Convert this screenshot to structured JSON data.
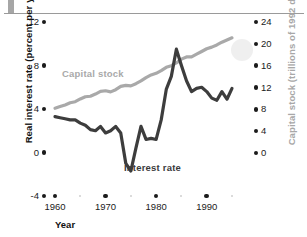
{
  "figure": {
    "left_axis_title": "Real interest rate (percent per year)",
    "right_axis_title": "Capital stock (trillions of 1992 dollars)",
    "x_axis_title": "Year",
    "series_labels": {
      "capital_stock": "Capital stock",
      "interest_rate": "Interest rate"
    },
    "colors": {
      "capital_stock": "#a9a9a9",
      "interest_rate": "#3d3d3d",
      "tick": "#1b1b1b",
      "minor_tick": "#cfcfcf",
      "rule": "#9a9a9a",
      "blob": "#ececec"
    }
  },
  "left_ticks": [
    "12",
    "8",
    "4",
    "0",
    "-4"
  ],
  "right_ticks": [
    "24",
    "20",
    "16",
    "12",
    "8",
    "4",
    "0"
  ],
  "x_ticks": [
    "1960",
    "1970",
    "1980",
    "1990"
  ],
  "chart_data": {
    "type": "line",
    "title": "",
    "xlabel": "Year",
    "ylabel": "Real interest rate (percent per year)",
    "y2label": "Capital stock (trillions of 1992 dollars)",
    "xlim": [
      1959,
      1996
    ],
    "ylim": [
      -4,
      12
    ],
    "y2lim": [
      0,
      24
    ],
    "grid": false,
    "legend": "inline-labels",
    "x_tick_labels": [
      "1960",
      "1970",
      "1980",
      "1990"
    ],
    "y_tick_labels": [
      "-4",
      "0",
      "4",
      "8",
      "12"
    ],
    "y2_tick_labels": [
      "0",
      "4",
      "8",
      "12",
      "16",
      "20",
      "24"
    ],
    "x": [
      1960,
      1961,
      1962,
      1963,
      1964,
      1965,
      1966,
      1967,
      1968,
      1969,
      1970,
      1971,
      1972,
      1973,
      1974,
      1975,
      1976,
      1977,
      1978,
      1979,
      1980,
      1981,
      1982,
      1983,
      1984,
      1985,
      1986,
      1987,
      1988,
      1989,
      1990,
      1991,
      1992,
      1993,
      1994,
      1995
    ],
    "series": [
      {
        "name": "Interest rate",
        "axis": "left",
        "color": "#3d3d3d",
        "unit": "percent per year",
        "values": [
          3.3,
          3.2,
          3.1,
          3.0,
          3.0,
          2.7,
          2.5,
          2.1,
          2.0,
          2.4,
          1.8,
          2.0,
          2.4,
          1.8,
          -1.0,
          -1.7,
          0.4,
          2.4,
          1.2,
          1.3,
          1.2,
          3.0,
          5.8,
          7.0,
          9.5,
          8.0,
          6.6,
          5.6,
          5.9,
          6.0,
          5.6,
          5.0,
          4.8,
          5.6,
          4.9,
          5.9
        ]
      },
      {
        "name": "Capital stock",
        "axis": "right",
        "color": "#a9a9a9",
        "unit": "trillions of 1992 dollars",
        "values": [
          8.2,
          8.5,
          8.8,
          9.2,
          9.4,
          9.9,
          10.3,
          10.4,
          10.8,
          11.3,
          11.4,
          11.2,
          11.6,
          12.2,
          12.4,
          12.3,
          12.7,
          13.2,
          13.8,
          14.3,
          14.6,
          15.1,
          15.7,
          16.0,
          16.5,
          17.2,
          17.6,
          17.6,
          18.1,
          18.6,
          19.1,
          19.4,
          19.8,
          20.3,
          20.7,
          21.1
        ]
      }
    ],
    "annotations": [
      {
        "text": "Capital stock",
        "near_x": 1966,
        "color": "#a9a9a9"
      },
      {
        "text": "Interest rate",
        "near_x": 1976,
        "color": "#3d3d3d"
      }
    ]
  }
}
